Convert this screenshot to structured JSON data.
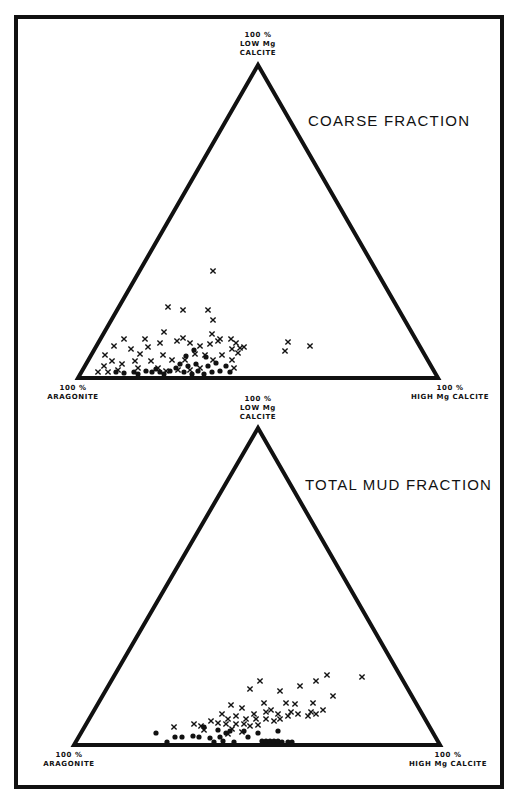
{
  "figure": {
    "top": {
      "title": "COARSE FRACTION",
      "apex_label": [
        "100 %",
        "LOW Mg",
        "CALCITE"
      ],
      "left_label": [
        "100 %",
        "ARAGONITE"
      ],
      "right_label": [
        "100 %",
        "HIGH Mg CALCITE"
      ]
    },
    "bottom": {
      "title": "TOTAL MUD FRACTION",
      "apex_label": [
        "100 %",
        "LOW Mg",
        "CALCITE"
      ],
      "left_label": [
        "100 %",
        "ARAGONITE"
      ],
      "right_label": [
        "100 %",
        "HIGH Mg CALCITE"
      ]
    },
    "colors": {
      "ink": "#111111",
      "background": "#ffffff"
    }
  },
  "chart_data": [
    {
      "type": "scatter",
      "subtype": "ternary",
      "title": "COARSE FRACTION",
      "axes": {
        "apex": "100 % LOW Mg CALCITE",
        "left": "100 % ARAGONITE",
        "right": "100 % HIGH Mg CALCITE"
      },
      "legend": [],
      "grid": false,
      "triangle_px": {
        "apex": [
          258,
          65
        ],
        "left": [
          78,
          378
        ],
        "right": [
          438,
          378
        ]
      },
      "series": [
        {
          "name": "x",
          "marker": "cross",
          "points_px": [
            [
              213,
              271
            ],
            [
              168,
              307
            ],
            [
              183,
              310
            ],
            [
              208,
              310
            ],
            [
              213,
              320
            ],
            [
              164,
              332
            ],
            [
              183,
              338
            ],
            [
              212,
              334
            ],
            [
              220,
              339
            ],
            [
              124,
              339
            ],
            [
              145,
              339
            ],
            [
              105,
              355
            ],
            [
              114,
              346
            ],
            [
              131,
              349
            ],
            [
              148,
              347
            ],
            [
              160,
              343
            ],
            [
              177,
              341
            ],
            [
              190,
              343
            ],
            [
              200,
              346
            ],
            [
              210,
              344
            ],
            [
              218,
              341
            ],
            [
              231,
              339
            ],
            [
              236,
              343
            ],
            [
              240,
              348
            ],
            [
              238,
              353
            ],
            [
              244,
              347
            ],
            [
              232,
              349
            ],
            [
              104,
              366
            ],
            [
              112,
              361
            ],
            [
              122,
              364
            ],
            [
              135,
              361
            ],
            [
              140,
              354
            ],
            [
              151,
              361
            ],
            [
              163,
              355
            ],
            [
              172,
              360
            ],
            [
              185,
              360
            ],
            [
              195,
              354
            ],
            [
              205,
              355
            ],
            [
              213,
              360
            ],
            [
              222,
              355
            ],
            [
              232,
              360
            ],
            [
              288,
              342
            ],
            [
              310,
              346
            ],
            [
              285,
              351
            ],
            [
              98,
              372
            ],
            [
              108,
              372
            ],
            [
              118,
              370
            ],
            [
              138,
              368
            ],
            [
              158,
              368
            ],
            [
              166,
              371
            ],
            [
              178,
              370
            ],
            [
              190,
              370
            ],
            [
              200,
              368
            ],
            [
              234,
              368
            ]
          ],
          "approx_ternary_pct": [
            {
              "aragonite": 45,
              "low_mg_calcite": 34,
              "high_mg_calcite": 20
            },
            {
              "aragonite": 63,
              "low_mg_calcite": 23,
              "high_mg_calcite": 14
            },
            {
              "aragonite": 60,
              "low_mg_calcite": 22,
              "high_mg_calcite": 18
            },
            {
              "aragonite": 53,
              "low_mg_calcite": 22,
              "high_mg_calcite": 25
            },
            {
              "aragonite": 53,
              "low_mg_calcite": 19,
              "high_mg_calcite": 28
            },
            {
              "aragonite": 35,
              "low_mg_calcite": 12,
              "high_mg_calcite": 53
            },
            {
              "aragonite": 31,
              "low_mg_calcite": 10,
              "high_mg_calcite": 59
            },
            {
              "aragonite": 38,
              "low_mg_calcite": 9,
              "high_mg_calcite": 53
            }
          ]
        },
        {
          "name": "dot",
          "marker": "filled-circle",
          "points_px": [
            [
              116,
              372
            ],
            [
              124,
              373
            ],
            [
              134,
              372
            ],
            [
              138,
              374
            ],
            [
              146,
              371
            ],
            [
              152,
              372
            ],
            [
              156,
              369
            ],
            [
              160,
              372
            ],
            [
              164,
              374
            ],
            [
              170,
              371
            ],
            [
              176,
              368
            ],
            [
              180,
              364
            ],
            [
              184,
              372
            ],
            [
              188,
              366
            ],
            [
              192,
              374
            ],
            [
              196,
              364
            ],
            [
              198,
              371
            ],
            [
              204,
              374
            ],
            [
              208,
              366
            ],
            [
              212,
              372
            ],
            [
              216,
              363
            ],
            [
              220,
              371
            ],
            [
              226,
              366
            ],
            [
              206,
              357
            ],
            [
              186,
              356
            ],
            [
              194,
              350
            ],
            [
              230,
              372
            ]
          ]
        }
      ]
    },
    {
      "type": "scatter",
      "subtype": "ternary",
      "title": "TOTAL MUD FRACTION",
      "axes": {
        "apex": "100 % LOW Mg CALCITE",
        "left": "100 % ARAGONITE",
        "right": "100 % HIGH Mg CALCITE"
      },
      "legend": [],
      "grid": false,
      "triangle_px": {
        "apex": [
          258,
          428
        ],
        "left": [
          74,
          745
        ],
        "right": [
          440,
          745
        ]
      },
      "series": [
        {
          "name": "x",
          "marker": "cross",
          "points_px": [
            [
              260,
              681
            ],
            [
              280,
              691
            ],
            [
              300,
              686
            ],
            [
              316,
              681
            ],
            [
              327,
              675
            ],
            [
              362,
              677
            ],
            [
              333,
              696
            ],
            [
              250,
              689
            ],
            [
              264,
              703
            ],
            [
              286,
              703
            ],
            [
              295,
              704
            ],
            [
              313,
              703
            ],
            [
              311,
              712
            ],
            [
              323,
              710
            ],
            [
              291,
              712
            ],
            [
              271,
              710
            ],
            [
              231,
              705
            ],
            [
              242,
              708
            ],
            [
              254,
              714
            ],
            [
              266,
              712
            ],
            [
              278,
              714
            ],
            [
              288,
              716
            ],
            [
              298,
              714
            ],
            [
              308,
              716
            ],
            [
              316,
              714
            ],
            [
              222,
              714
            ],
            [
              228,
              719
            ],
            [
              236,
              716
            ],
            [
              246,
              719
            ],
            [
              256,
              719
            ],
            [
              266,
              719
            ],
            [
              274,
              721
            ],
            [
              280,
              719
            ],
            [
              211,
              721
            ],
            [
              218,
              723
            ],
            [
              226,
              724
            ],
            [
              236,
              724
            ],
            [
              244,
              724
            ],
            [
              250,
              726
            ],
            [
              258,
              725
            ],
            [
              194,
              724
            ],
            [
              201,
              726
            ],
            [
              174,
              727
            ],
            [
              204,
              730
            ],
            [
              232,
              729
            ],
            [
              242,
              732
            ],
            [
              228,
              734
            ]
          ],
          "approx_ternary_pct": [
            {
              "aragonite": 37,
              "low_mg_calcite": 20,
              "high_mg_calcite": 43
            },
            {
              "aragonite": 14,
              "low_mg_calcite": 21,
              "high_mg_calcite": 65
            },
            {
              "aragonite": 23,
              "low_mg_calcite": 15,
              "high_mg_calcite": 62
            },
            {
              "aragonite": 55,
              "low_mg_calcite": 8,
              "high_mg_calcite": 37
            }
          ]
        },
        {
          "name": "dot",
          "marker": "filled-circle",
          "points_px": [
            [
              156,
              733
            ],
            [
              167,
              742
            ],
            [
              175,
              737
            ],
            [
              182,
              737
            ],
            [
              193,
              736
            ],
            [
              199,
              737
            ],
            [
              204,
              727
            ],
            [
              210,
              738
            ],
            [
              214,
              742
            ],
            [
              218,
              730
            ],
            [
              220,
              737
            ],
            [
              223,
              741
            ],
            [
              226,
              733
            ],
            [
              230,
              731
            ],
            [
              244,
              731
            ],
            [
              248,
              737
            ],
            [
              234,
              742
            ],
            [
              258,
              733
            ],
            [
              262,
              741
            ],
            [
              266,
              741
            ],
            [
              270,
              741
            ],
            [
              274,
              741
            ],
            [
              278,
              741
            ],
            [
              282,
              742
            ],
            [
              278,
              731
            ],
            [
              288,
              742
            ],
            [
              292,
              742
            ]
          ]
        }
      ]
    }
  ]
}
